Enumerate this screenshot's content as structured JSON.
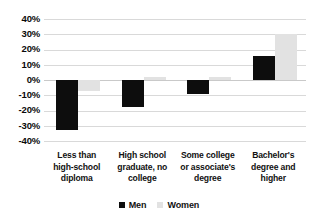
{
  "chart_data": {
    "type": "bar",
    "title": "",
    "subtitle": "",
    "xlabel": "",
    "ylabel": "",
    "ylim": [
      -40,
      40
    ],
    "ytick_values": [
      40,
      30,
      20,
      10,
      0,
      -10,
      -20,
      -30,
      -40
    ],
    "ytick_labels": [
      "40%",
      "30%",
      "20%",
      "10%",
      "0%",
      "-10%",
      "-20%",
      "-30%",
      "-40%"
    ],
    "grid": true,
    "legend_position": "bottom-center",
    "categories": [
      "Less than high-school diploma",
      "High school graduate, no college",
      "Some college or associate's degree",
      "Bachelor's degree and higher"
    ],
    "category_lines": [
      [
        "Less than",
        "high-school",
        "diploma"
      ],
      [
        "High school",
        "graduate, no",
        "college"
      ],
      [
        "Some college",
        "or associate's",
        "degree"
      ],
      [
        "Bachelor's",
        "degree and",
        "higher"
      ]
    ],
    "series": [
      {
        "name": "Men",
        "color": "#0d0d0d",
        "values": [
          -33,
          -18,
          -9,
          16
        ]
      },
      {
        "name": "Women",
        "color": "#e2e2e2",
        "values": [
          -7,
          2,
          2,
          30
        ]
      }
    ]
  },
  "legend": {
    "items": [
      {
        "label": "Men",
        "swatch": "men-swatch"
      },
      {
        "label": "Women",
        "swatch": "women-swatch"
      }
    ]
  }
}
